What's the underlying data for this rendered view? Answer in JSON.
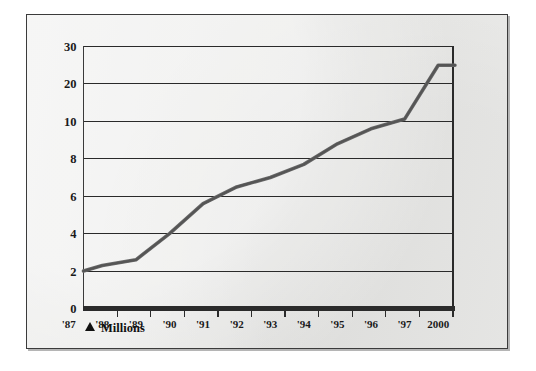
{
  "figure": {
    "background_color": "#e9e9e7",
    "frame_color": "#3b3b3b",
    "line_color": "#6a6a6a",
    "gridline_color": "#2a2a2a",
    "axis_color": "#2b2b2b",
    "unit_note": {
      "marker": "▲",
      "label": "Millions"
    }
  },
  "chart_data": {
    "type": "line",
    "title": "",
    "subtitle": "",
    "xlabel": "",
    "ylabel": "",
    "unit_annotation": "▲ Millions",
    "grid": true,
    "legend_position": "none",
    "y_axis": {
      "scale": "nonlinear-custom",
      "ticks": [
        0,
        2,
        4,
        6,
        8,
        10,
        20,
        30
      ],
      "tick_labels": [
        "0",
        "2",
        "4",
        "6",
        "8",
        "10",
        "20",
        "30"
      ],
      "ylim": [
        0,
        30
      ],
      "note": "Ticks are evenly spaced on the page even though 10-20-30 are decade steps"
    },
    "x_axis": {
      "tick_labels": [
        "'87",
        "'88",
        "'89",
        "'90",
        "'91",
        "'92",
        "'93",
        "'94",
        "'95",
        "'96",
        "'97",
        "2000"
      ],
      "categories": [
        "'87",
        "'88",
        "'89",
        "'90",
        "'91",
        "'92",
        "'93",
        "'94",
        "'95",
        "'96",
        "'97",
        "2000"
      ]
    },
    "series": [
      {
        "name": "Millions",
        "color": "#6a6a6a",
        "x": [
          "'87",
          "'88",
          "'89",
          "'90",
          "'91",
          "'92",
          "'93",
          "'94",
          "'95",
          "'96",
          "'97",
          "2000"
        ],
        "values": [
          2.0,
          2.3,
          2.6,
          4.0,
          5.6,
          6.5,
          7.0,
          7.7,
          8.8,
          9.6,
          10.6,
          25.0
        ]
      }
    ]
  }
}
